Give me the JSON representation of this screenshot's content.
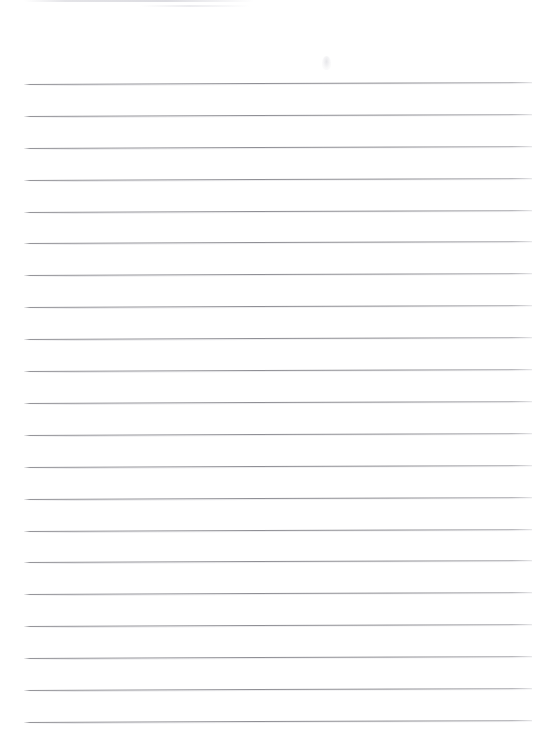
{
  "document": {
    "kind": "lined-notebook-paper-scan",
    "title": "Blank ruled paper",
    "background_color": "#ffffff",
    "rule_color": "#8a8a90",
    "page_width": 544,
    "page_height": 743,
    "content_text": "",
    "ruled_lines": {
      "count": 21,
      "first_line_y": 84,
      "spacing": 31.9,
      "left_x": 24,
      "right_x": 532,
      "slant_degrees": -0.22,
      "y_positions": [
        84,
        116,
        148,
        180,
        212,
        243,
        275,
        307,
        339,
        371,
        403,
        435,
        467,
        499,
        531,
        562,
        594,
        626,
        658,
        690,
        722
      ]
    },
    "artifacts": [
      {
        "name": "top-edge-scan-band",
        "x": 24,
        "y": 0,
        "width": 230,
        "height": 2,
        "color": "#e2e2e6"
      },
      {
        "name": "top-edge-scan-band-secondary",
        "x": 140,
        "y": 5,
        "width": 110,
        "height": 2,
        "color": "#e8e8ec"
      },
      {
        "name": "pencil-smudge",
        "x": 322,
        "y": 56,
        "width": 9,
        "height": 14,
        "color": "#e2e2e6"
      }
    ]
  }
}
